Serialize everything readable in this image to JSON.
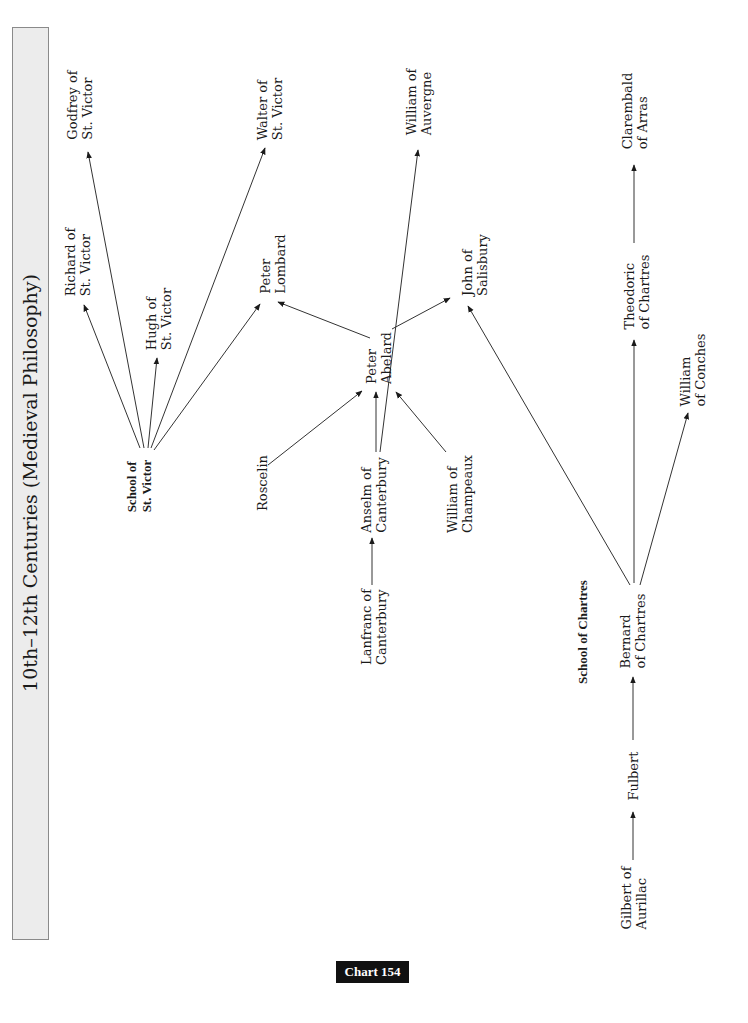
{
  "title": "10th–12th Centuries (Medieval Philosophy)",
  "badge": "Chart 154",
  "groups": {
    "st_victor": "School of\nSt. Victor",
    "chartres": "School of Chartres"
  },
  "nodes": {
    "school_st_victor": [
      "School of",
      "St. Victor"
    ],
    "richard": [
      "Richard of",
      "St. Victor"
    ],
    "godfrey": [
      "Godfrey of",
      "St. Victor"
    ],
    "hugh": [
      "Hugh of",
      "St. Victor"
    ],
    "walter": [
      "Walter of",
      "St. Victor"
    ],
    "peter_lombard": [
      "Peter",
      "Lombard"
    ],
    "roscelin": [
      "Roscelin"
    ],
    "peter_abelard": [
      "Peter",
      "Abelard"
    ],
    "anselm": [
      "Anselm of",
      "Canterbury"
    ],
    "william_champeaux": [
      "William of",
      "Champeaux"
    ],
    "lanfranc": [
      "Lanfranc of",
      "Canterbury"
    ],
    "william_auvergne": [
      "William of",
      "Auvergne"
    ],
    "john_salisbury": [
      "John of",
      "Salisbury"
    ],
    "claremald": [
      "Clarembald",
      "of Arras"
    ],
    "theodoric": [
      "Theodoric",
      "of  Chartres"
    ],
    "william_conches": [
      "William",
      "of Conches"
    ],
    "bernard": [
      "Bernard",
      "of Chartres"
    ],
    "fulbert": [
      "Fulbert"
    ],
    "gilbert": [
      "Gilbert of",
      "Aurillac"
    ]
  },
  "edges": [
    {
      "from": "School of St. Victor",
      "to": "Richard of St. Victor"
    },
    {
      "from": "School of St. Victor",
      "to": "Godfrey of St. Victor"
    },
    {
      "from": "School of St. Victor",
      "to": "Hugh of St. Victor"
    },
    {
      "from": "School of St. Victor",
      "to": "Walter of St. Victor"
    },
    {
      "from": "School of St. Victor",
      "to": "Peter Lombard"
    },
    {
      "from": "Peter Abelard",
      "to": "Peter Lombard"
    },
    {
      "from": "Peter Abelard",
      "to": "John of Salisbury"
    },
    {
      "from": "Roscelin",
      "to": "Peter Abelard"
    },
    {
      "from": "Anselm of Canterbury",
      "to": "Peter Abelard"
    },
    {
      "from": "Anselm of Canterbury",
      "to": "William of Auvergne"
    },
    {
      "from": "William of Champeaux",
      "to": "Peter Abelard"
    },
    {
      "from": "Lanfranc of Canterbury",
      "to": "Anselm of Canterbury"
    },
    {
      "from": "Gilbert of Aurillac",
      "to": "Fulbert"
    },
    {
      "from": "Fulbert",
      "to": "Bernard of Chartres"
    },
    {
      "from": "Bernard of Chartres",
      "to": "John of Salisbury"
    },
    {
      "from": "Bernard of Chartres",
      "to": "Theodoric of Chartres"
    },
    {
      "from": "Bernard of Chartres",
      "to": "William of Conches"
    },
    {
      "from": "Theodoric of Chartres",
      "to": "Clarembald of Arras"
    }
  ]
}
